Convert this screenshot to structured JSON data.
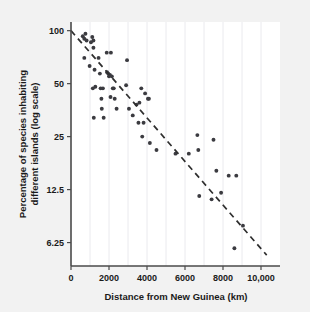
{
  "figure": {
    "background_color": "#f2f2f2",
    "plot_background_color": "#ffffff",
    "point_color": "#3b3b40",
    "trendline_color": "#2e2e2e",
    "axis_color": "#4a4a4a",
    "gridline_color": "#e4e4ea"
  },
  "chart_data": {
    "type": "scatter",
    "title": "",
    "xlabel": "Distance from New Guinea (km)",
    "ylabel": "Percentage of species inhabiting different islands (log scale)",
    "ylabel_lines": [
      "Percentage of species inhabiting",
      "different islands (log scale)"
    ],
    "xlim": [
      0,
      11000
    ],
    "ylim": [
      4.6,
      112
    ],
    "yscale": "log",
    "xscale": "linear",
    "grid": "vertical-minor-only",
    "legend": "none",
    "xticks": [
      0,
      2000,
      4000,
      6000,
      8000,
      10000
    ],
    "xticklabels": [
      "0",
      "2000",
      "4000",
      "6000",
      "8000",
      "10,000"
    ],
    "yticks": [
      100,
      50,
      25,
      12.5,
      6.25
    ],
    "yticklabels": [
      "100",
      "50",
      "25",
      "12.5",
      "6.25"
    ],
    "trendline": {
      "type": "log-linear-fit",
      "style": "dashed",
      "x_start": 0,
      "y_start": 100,
      "x_end": 10300,
      "y_end": 5.3
    },
    "points": [
      {
        "x": 620,
        "y": 93
      },
      {
        "x": 700,
        "y": 90
      },
      {
        "x": 760,
        "y": 96
      },
      {
        "x": 820,
        "y": 88
      },
      {
        "x": 700,
        "y": 70
      },
      {
        "x": 980,
        "y": 63
      },
      {
        "x": 1050,
        "y": 86
      },
      {
        "x": 1120,
        "y": 92
      },
      {
        "x": 1180,
        "y": 88
      },
      {
        "x": 1180,
        "y": 80
      },
      {
        "x": 1240,
        "y": 60
      },
      {
        "x": 1280,
        "y": 48
      },
      {
        "x": 1150,
        "y": 47
      },
      {
        "x": 1200,
        "y": 32
      },
      {
        "x": 1450,
        "y": 70
      },
      {
        "x": 1520,
        "y": 57
      },
      {
        "x": 1560,
        "y": 47
      },
      {
        "x": 1600,
        "y": 41
      },
      {
        "x": 1620,
        "y": 36
      },
      {
        "x": 1680,
        "y": 47
      },
      {
        "x": 1720,
        "y": 32
      },
      {
        "x": 1880,
        "y": 75
      },
      {
        "x": 1900,
        "y": 58
      },
      {
        "x": 1960,
        "y": 57
      },
      {
        "x": 2000,
        "y": 55
      },
      {
        "x": 2050,
        "y": 56
      },
      {
        "x": 2080,
        "y": 42
      },
      {
        "x": 2100,
        "y": 75
      },
      {
        "x": 2150,
        "y": 55
      },
      {
        "x": 2200,
        "y": 47
      },
      {
        "x": 2250,
        "y": 47
      },
      {
        "x": 2300,
        "y": 41
      },
      {
        "x": 2400,
        "y": 36
      },
      {
        "x": 2900,
        "y": 49
      },
      {
        "x": 2950,
        "y": 68
      },
      {
        "x": 3050,
        "y": 36
      },
      {
        "x": 3250,
        "y": 33
      },
      {
        "x": 3450,
        "y": 38
      },
      {
        "x": 3550,
        "y": 30
      },
      {
        "x": 3600,
        "y": 39
      },
      {
        "x": 3700,
        "y": 47
      },
      {
        "x": 3750,
        "y": 25
      },
      {
        "x": 3820,
        "y": 30
      },
      {
        "x": 3900,
        "y": 44
      },
      {
        "x": 4050,
        "y": 41
      },
      {
        "x": 4100,
        "y": 41
      },
      {
        "x": 4150,
        "y": 23
      },
      {
        "x": 4500,
        "y": 21
      },
      {
        "x": 5500,
        "y": 20
      },
      {
        "x": 6200,
        "y": 20
      },
      {
        "x": 6650,
        "y": 25.5
      },
      {
        "x": 6700,
        "y": 21
      },
      {
        "x": 6750,
        "y": 11.5
      },
      {
        "x": 7400,
        "y": 11
      },
      {
        "x": 7500,
        "y": 24
      },
      {
        "x": 7650,
        "y": 16
      },
      {
        "x": 7900,
        "y": 12
      },
      {
        "x": 8300,
        "y": 15
      },
      {
        "x": 8700,
        "y": 15
      },
      {
        "x": 8600,
        "y": 5.8
      },
      {
        "x": 9050,
        "y": 7.8
      }
    ]
  }
}
